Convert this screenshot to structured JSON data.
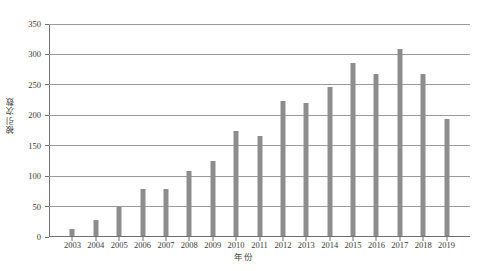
{
  "chart_data": {
    "type": "bar",
    "title": "",
    "xlabel": "年份",
    "ylabel": "被引次数",
    "categories": [
      "2003",
      "2004",
      "2005",
      "2006",
      "2007",
      "2008",
      "2009",
      "2010",
      "2011",
      "2012",
      "2013",
      "2014",
      "2015",
      "2016",
      "2017",
      "2018",
      "2019"
    ],
    "values": [
      11,
      27,
      47,
      77,
      77,
      107,
      124,
      173,
      165,
      222,
      218,
      245,
      285,
      267,
      307,
      266,
      192
    ],
    "ylim": [
      0,
      350
    ],
    "ytick_labels": [
      "0",
      "50",
      "100",
      "150",
      "200",
      "250",
      "300",
      "350"
    ],
    "ytick_values": [
      0,
      50,
      100,
      150,
      200,
      250,
      300,
      350
    ],
    "ytick_step": 50,
    "grid": true,
    "grid_axis": "y",
    "legend": false,
    "legend_position": "none",
    "bar_color": "#8d8d8d",
    "grid_color": "#9a9a9a",
    "axis_color": "#6f6f6f",
    "background_color": "#ffffff"
  }
}
